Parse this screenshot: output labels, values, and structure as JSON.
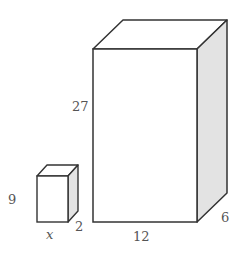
{
  "diagram": {
    "type": "two rectangular prisms (boxes) with labeled dimensions",
    "colors": {
      "stroke": "#333333",
      "front_face": "#ffffff",
      "top_face": "#ffffff",
      "side_face": "#e3e3e3",
      "label": "#555555"
    },
    "small_box": {
      "height_label": "9",
      "width_label": "x",
      "depth_label": "2"
    },
    "large_box": {
      "height_label": "27",
      "width_label": "12",
      "depth_label": "6"
    }
  }
}
